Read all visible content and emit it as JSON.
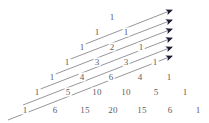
{
  "figure": {
    "number_color": "#5d5d62",
    "arrow_line_color": "#8a8a90",
    "arrow_head_color": "#1b1b33",
    "background_color": "#ffffff"
  },
  "chart_data": {
    "type": "table",
    "xlabel": "",
    "ylabel": "",
    "rows": [
      {
        "row_index": 0,
        "values": [
          1
        ]
      },
      {
        "row_index": 1,
        "values": [
          1,
          1
        ]
      },
      {
        "row_index": 2,
        "values": [
          1,
          2,
          1
        ]
      },
      {
        "row_index": 3,
        "values": [
          1,
          3,
          3,
          1
        ]
      },
      {
        "row_index": 4,
        "values": [
          1,
          4,
          6,
          4,
          1
        ]
      },
      {
        "row_index": 5,
        "values": [
          1,
          5,
          10,
          10,
          5,
          1
        ]
      },
      {
        "row_index": 6,
        "values": [
          1,
          6,
          15,
          20,
          15,
          6,
          1
        ]
      }
    ],
    "annotations": [
      {
        "name": "diagonal-arrow-1",
        "sum": 1
      },
      {
        "name": "diagonal-arrow-2",
        "sum": 2
      },
      {
        "name": "diagonal-arrow-3",
        "sum": 3
      },
      {
        "name": "diagonal-arrow-4",
        "sum": 5
      },
      {
        "name": "diagonal-arrow-5",
        "sum": 8
      },
      {
        "name": "diagonal-arrow-6",
        "sum": 13
      }
    ],
    "legend": [],
    "grid": false
  },
  "cells": [
    {
      "label": "1",
      "x": 112,
      "y": 17
    },
    {
      "label": "1",
      "x": 97,
      "y": 32
    },
    {
      "label": "1",
      "x": 126,
      "y": 32
    },
    {
      "label": "1",
      "x": 82,
      "y": 47
    },
    {
      "label": "2",
      "x": 112,
      "y": 47
    },
    {
      "label": "1",
      "x": 141,
      "y": 47
    },
    {
      "label": "1",
      "x": 67,
      "y": 62
    },
    {
      "label": "3",
      "x": 97,
      "y": 62
    },
    {
      "label": "3",
      "x": 126,
      "y": 62
    },
    {
      "label": "1",
      "x": 155,
      "y": 62
    },
    {
      "label": "1",
      "x": 52,
      "y": 77
    },
    {
      "label": "4",
      "x": 82,
      "y": 77
    },
    {
      "label": "6",
      "x": 111,
      "y": 77
    },
    {
      "label": "4",
      "x": 140,
      "y": 77
    },
    {
      "label": "1",
      "x": 169,
      "y": 77
    },
    {
      "label": "1",
      "x": 37,
      "y": 92
    },
    {
      "label": "5",
      "x": 68,
      "y": 92
    },
    {
      "label": "10",
      "x": 97,
      "y": 92
    },
    {
      "label": "10",
      "x": 126,
      "y": 92
    },
    {
      "label": "5",
      "x": 156,
      "y": 92
    },
    {
      "label": "1",
      "x": 185,
      "y": 92
    },
    {
      "label": "1",
      "x": 25,
      "y": 110
    },
    {
      "label": "6",
      "x": 55,
      "y": 110
    },
    {
      "label": "15",
      "x": 85,
      "y": 110
    },
    {
      "label": "20",
      "x": 113,
      "y": 110
    },
    {
      "label": "15",
      "x": 142,
      "y": 110
    },
    {
      "label": "6",
      "x": 170,
      "y": 110
    },
    {
      "label": "1",
      "x": 198,
      "y": 110
    }
  ],
  "arrows": [
    {
      "name": "diagonal-arrow-6",
      "x1": 8,
      "y1": 120,
      "x2": 172,
      "y2": 56
    },
    {
      "name": "diagonal-arrow-5",
      "x1": 23,
      "y1": 105,
      "x2": 172,
      "y2": 47
    },
    {
      "name": "diagonal-arrow-4",
      "x1": 38,
      "y1": 90,
      "x2": 172,
      "y2": 38
    },
    {
      "name": "diagonal-arrow-3",
      "x1": 53,
      "y1": 75,
      "x2": 172,
      "y2": 29
    },
    {
      "name": "diagonal-arrow-2",
      "x1": 68,
      "y1": 60,
      "x2": 172,
      "y2": 20
    },
    {
      "name": "diagonal-arrow-1",
      "x1": 83,
      "y1": 45,
      "x2": 172,
      "y2": 10
    }
  ]
}
